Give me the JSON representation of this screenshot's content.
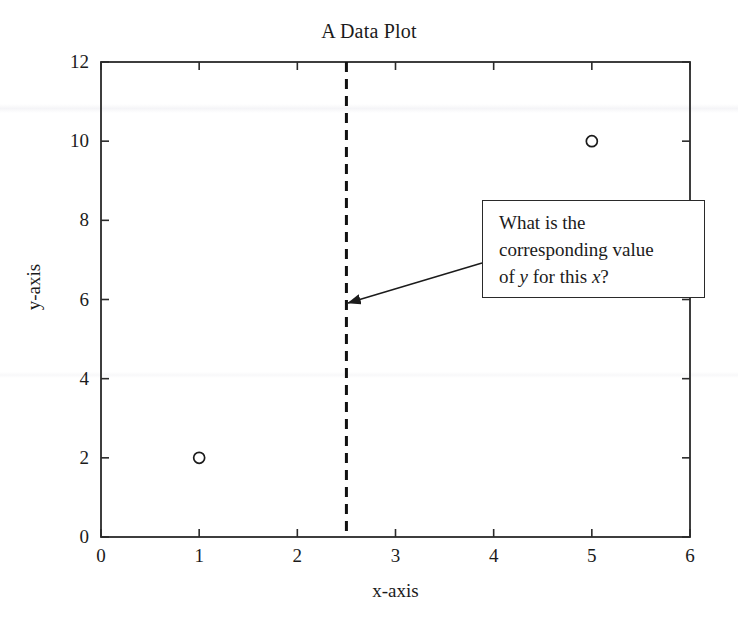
{
  "chart_data": {
    "type": "scatter",
    "title": "A Data Plot",
    "xlabel": "x-axis",
    "ylabel": "y-axis",
    "xlim": [
      0,
      6
    ],
    "ylim": [
      0,
      12
    ],
    "xticks": [
      "0",
      "1",
      "2",
      "3",
      "4",
      "5",
      "6"
    ],
    "yticks": [
      "0",
      "2",
      "4",
      "6",
      "8",
      "10",
      "12"
    ],
    "xtick_values": [
      0,
      1,
      2,
      3,
      4,
      5,
      6
    ],
    "ytick_values": [
      0,
      2,
      4,
      6,
      8,
      10,
      12
    ],
    "grid": false,
    "legend": "none",
    "series": [
      {
        "name": "data points",
        "marker": "open-circle",
        "color": "#1b1b1b",
        "points": [
          {
            "x": 1,
            "y": 2
          },
          {
            "x": 5,
            "y": 10
          }
        ]
      }
    ],
    "reference_lines": [
      {
        "name": "query-x",
        "orientation": "vertical",
        "x": 2.5,
        "style": "dashed",
        "color": "#111111",
        "width": 3
      }
    ],
    "annotations": [
      {
        "name": "question-callout",
        "text_lines": [
          "What is the",
          "corresponding value",
          "of y for this x?"
        ],
        "text_plain": "What is the corresponding value of y for this x?",
        "italic_tokens": [
          "y",
          "x"
        ],
        "box": {
          "x": 482,
          "y": 200,
          "width": 223,
          "height": 98
        },
        "arrow_from": {
          "x": 482,
          "y": 263
        },
        "arrow_to": {
          "x": 348,
          "y": 303
        },
        "arrow_target_data": {
          "x": 2.5,
          "y": 5.8
        }
      }
    ]
  },
  "figure": {
    "background_color": "#ffffff",
    "frame_color": "#2a2a2a",
    "text_color": "#1b1b1b"
  }
}
